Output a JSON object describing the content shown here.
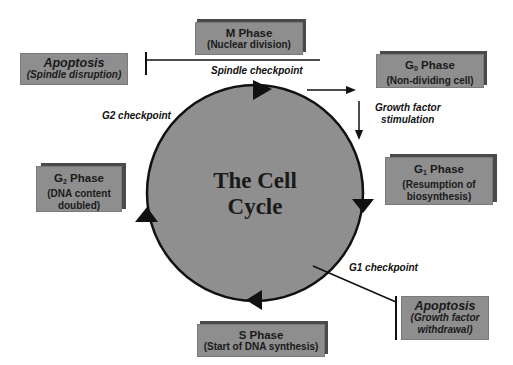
{
  "diagram": {
    "center_title_line1": "The Cell",
    "center_title_line2": "Cycle",
    "phases": {
      "m": {
        "title": "M Phase",
        "subtitle": "(Nuclear division)"
      },
      "g0": {
        "title_main": "G",
        "title_sub": "0",
        "title_rest": " Phase",
        "subtitle": "(Non-dividing cell)"
      },
      "g1": {
        "title_main": "G",
        "title_sub": "1",
        "title_rest": " Phase",
        "subtitle_line1": "(Resumption of",
        "subtitle_line2": "biosynthesis)"
      },
      "s": {
        "title": "S Phase",
        "subtitle": "(Start of DNA synthesis)"
      },
      "g2": {
        "title_main": "G",
        "title_sub": "2",
        "title_rest": " Phase",
        "subtitle_line1": "(DNA content",
        "subtitle_line2": "doubled)"
      }
    },
    "apoptosis": {
      "spindle": {
        "title": "Apoptosis",
        "subtitle": "(Spindle disruption)"
      },
      "growth": {
        "title": "Apoptosis",
        "subtitle_line1": "(Growth factor",
        "subtitle_line2": "withdrawal)"
      }
    },
    "labels": {
      "spindle_checkpoint": "Spindle checkpoint",
      "g2_checkpoint": "G2 checkpoint",
      "g1_checkpoint": "G1 checkpoint",
      "growth_factor_line1": "Growth factor",
      "growth_factor_line2": "stimulation"
    },
    "colors": {
      "circle_fill": "#8f8f8f",
      "box_fill": "#8e8e8e",
      "box_shadow": "#4a4a4a",
      "stroke": "#111111"
    }
  }
}
